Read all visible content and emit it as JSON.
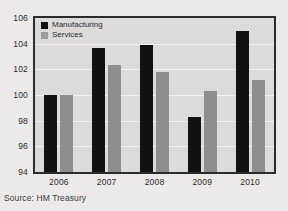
{
  "figure": {
    "source_note": "Source: HM Treasury",
    "top_crop_ghost": "..."
  },
  "legend": {
    "position": "top-left-inside",
    "entries": [
      {
        "label": "Manufacturing",
        "swatch": "black-square-swatch",
        "color": "#111111"
      },
      {
        "label": "Services",
        "swatch": "gray-square-swatch",
        "color": "#9b9b9b"
      }
    ]
  },
  "chart_data": {
    "type": "bar",
    "title": "",
    "subtitle": "",
    "xlabel": "",
    "ylabel": "",
    "categories": [
      "2006",
      "2007",
      "2008",
      "2009",
      "2010"
    ],
    "series": [
      {
        "name": "Manufacturing",
        "color": "#111111",
        "values": [
          100.0,
          103.7,
          103.9,
          98.3,
          105.0
        ]
      },
      {
        "name": "Services",
        "color": "#8e8e8e",
        "values": [
          100.0,
          102.3,
          101.8,
          100.3,
          101.2
        ]
      }
    ],
    "ylim": [
      94,
      106
    ],
    "yticks": [
      94,
      96,
      98,
      100,
      102,
      104,
      106
    ],
    "ytick_labels": [
      "94",
      "96",
      "98",
      "100",
      "102",
      "104",
      "106"
    ],
    "grid": true,
    "grid_color": "#f4f3f2",
    "plot_background": "#dcdbda",
    "legend_position": "upper left",
    "annotations": []
  }
}
